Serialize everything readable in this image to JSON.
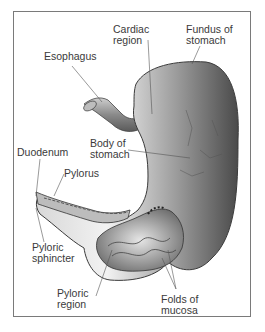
{
  "figure": {
    "labels": {
      "cardiac_region": [
        "Cardiac",
        "region"
      ],
      "fundus": [
        "Fundus of",
        "stomach"
      ],
      "esophagus": [
        "Esophagus"
      ],
      "body": [
        "Body of",
        "stomach"
      ],
      "duodenum": [
        "Duodenum"
      ],
      "pylorus": [
        "Pylorus"
      ],
      "pyloric_sphincter": [
        "Pyloric",
        "sphincter"
      ],
      "pyloric_region": [
        "Pyloric",
        "region"
      ],
      "folds": [
        "Folds of",
        "mucosa"
      ]
    },
    "colors": {
      "frame": "#7a7a7a",
      "text": "#3a3a3a",
      "leader": "#555555"
    }
  }
}
